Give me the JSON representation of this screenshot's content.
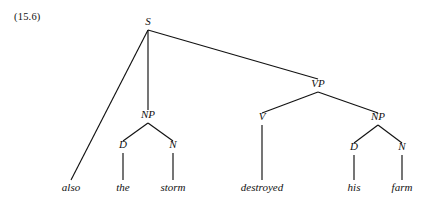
{
  "figure": {
    "example_number": "(15.6)",
    "caption": "",
    "background_color": "#ffffff",
    "ink_color": "#111111"
  },
  "tree": {
    "nodes": {
      "s": {
        "label": "S",
        "x": 148,
        "y": 25
      },
      "np_subject": {
        "label": "NP",
        "x": 148,
        "y": 118
      },
      "d_the": {
        "label": "D",
        "x": 123,
        "y": 148
      },
      "n_storm": {
        "label": "N",
        "x": 173,
        "y": 148
      },
      "vp": {
        "label": "VP",
        "x": 318,
        "y": 87
      },
      "v_destroyed": {
        "label": "V",
        "x": 262,
        "y": 120
      },
      "np_object": {
        "label": "NP",
        "x": 378,
        "y": 120
      },
      "d_his": {
        "label": "D",
        "x": 354,
        "y": 150
      },
      "n_farm": {
        "label": "N",
        "x": 402,
        "y": 150
      }
    },
    "words": [
      {
        "id": "word-also",
        "text": "also",
        "x": 71,
        "y": 191
      },
      {
        "id": "word-the",
        "text": "the",
        "x": 123,
        "y": 191
      },
      {
        "id": "word-storm",
        "text": "storm",
        "x": 173,
        "y": 191
      },
      {
        "id": "word-destroyed",
        "text": "destroyed",
        "x": 262,
        "y": 191
      },
      {
        "id": "word-his",
        "text": "his",
        "x": 354,
        "y": 191
      },
      {
        "id": "word-farm",
        "text": "farm",
        "x": 402,
        "y": 191
      }
    ],
    "sentence": "also the storm destroyed his farm"
  }
}
